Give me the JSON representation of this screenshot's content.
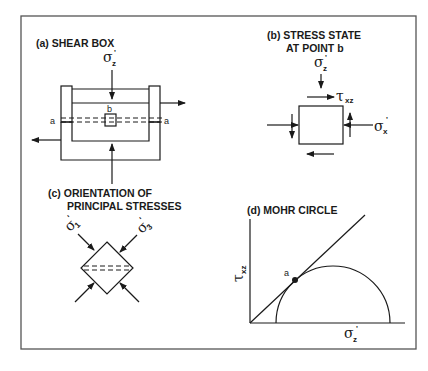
{
  "figure": {
    "panels": {
      "a": {
        "label": "(a)  SHEAR BOX",
        "load_symbol": "σ",
        "load_sub": "z",
        "load_prime": "'",
        "point_label": "b",
        "plane_left": "a",
        "plane_right": "a"
      },
      "b": {
        "label_line1": "(b)  STRESS STATE",
        "label_line2": "AT POINT b",
        "sz_symbol": "σ",
        "sz_sub": "z",
        "sz_prime": "'",
        "tau_symbol": "τ",
        "tau_sub": "xz",
        "sx_symbol": "σ",
        "sx_sub": "x",
        "sx_prime": "'"
      },
      "c": {
        "label_line1": "(c)  ORIENTATION OF",
        "label_line2": "PRINCIPAL STRESSES",
        "s1_symbol": "σ",
        "s1_sub": "1",
        "s1_prime": "'",
        "s3_symbol": "σ",
        "s3_sub": "3",
        "s3_prime": "'"
      },
      "d": {
        "label": "(d)  MOHR CIRCLE",
        "y_axis_symbol": "τ",
        "y_axis_sub": "xz",
        "x_axis_symbol": "σ",
        "x_axis_sub": "z",
        "x_axis_prime": "'",
        "tangent_point": "a"
      }
    },
    "colors": {
      "ink": "#1a1a1a",
      "frame": "#555555",
      "background": "#ffffff"
    }
  }
}
